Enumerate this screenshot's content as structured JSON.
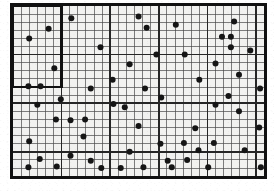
{
  "figure": {
    "image_width": 274,
    "image_height": 193
  },
  "colors": {
    "background": "#ffffff",
    "paper": "#f4f4f2",
    "cell_fill": "#f2f2f0",
    "grid_line": "#4a4a4a",
    "grid_line_major": "#262626",
    "outer_border": "#111111",
    "quadrat_border": "#111111",
    "dot_fill": "#151515"
  },
  "plot": {
    "name": "study-plot",
    "origin_x": 13,
    "origin_y": 6,
    "cell_size": 8.1,
    "columns": 31,
    "rows": 21,
    "outer_border_width": 3.2,
    "grid_line_width": 0.7,
    "major_line_width": 1.6,
    "major_column_interval": 6,
    "major_row_interval": 6
  },
  "quadrat": {
    "name": "sample-quadrat",
    "label": "sample quadrat",
    "col_start": 0,
    "col_end": 6,
    "row_start": 0,
    "row_end": 10,
    "border_width": 2.6
  },
  "points": {
    "name": "point-layer",
    "label": "sampled points",
    "radius": 3.0,
    "count": 60,
    "coordinates": [
      [
        6.7,
        1.0
      ],
      [
        1.5,
        3.5
      ],
      [
        4.6,
        7.2
      ],
      [
        1.4,
        9.4
      ],
      [
        2.9,
        9.4
      ],
      [
        15.0,
        0.8
      ],
      [
        16.0,
        2.2
      ],
      [
        19.6,
        1.8
      ],
      [
        25.3,
        3.3
      ],
      [
        26.4,
        3.3
      ],
      [
        26.4,
        4.6
      ],
      [
        10.3,
        4.6
      ],
      [
        17.2,
        5.5
      ],
      [
        20.7,
        5.5
      ],
      [
        13.9,
        6.7
      ],
      [
        24.5,
        6.6
      ],
      [
        27.4,
        8.0
      ],
      [
        11.8,
        8.6
      ],
      [
        22.5,
        8.6
      ],
      [
        30.0,
        9.7
      ],
      [
        9.1,
        9.7
      ],
      [
        15.8,
        9.7
      ],
      [
        26.1,
        10.6
      ],
      [
        11.9,
        11.6
      ],
      [
        24.5,
        11.7
      ],
      [
        27.4,
        12.5
      ],
      [
        2.5,
        11.7
      ],
      [
        4.8,
        13.5
      ],
      [
        6.6,
        13.6
      ],
      [
        8.4,
        13.5
      ],
      [
        17.8,
        10.8
      ],
      [
        15.0,
        14.3
      ],
      [
        29.9,
        14.5
      ],
      [
        1.5,
        16.2
      ],
      [
        17.7,
        16.5
      ],
      [
        20.6,
        16.4
      ],
      [
        24.3,
        16.4
      ],
      [
        22.4,
        17.3
      ],
      [
        28.1,
        17.3
      ],
      [
        13.9,
        17.5
      ],
      [
        6.6,
        18.0
      ],
      [
        2.8,
        18.4
      ],
      [
        9.1,
        18.6
      ],
      [
        21.0,
        18.5
      ],
      [
        1.4,
        19.4
      ],
      [
        10.4,
        19.5
      ],
      [
        12.8,
        19.5
      ],
      [
        15.6,
        19.4
      ],
      [
        18.6,
        18.6
      ],
      [
        23.6,
        19.4
      ],
      [
        30.1,
        19.4
      ],
      [
        5.4,
        11.0
      ],
      [
        4.9,
        19.3
      ],
      [
        19.1,
        19.4
      ],
      [
        8.2,
        15.6
      ],
      [
        13.3,
        12.0
      ],
      [
        28.8,
        5.0
      ],
      [
        22.0,
        14.6
      ],
      [
        26.8,
        1.4
      ],
      [
        3.9,
        2.3
      ]
    ]
  }
}
